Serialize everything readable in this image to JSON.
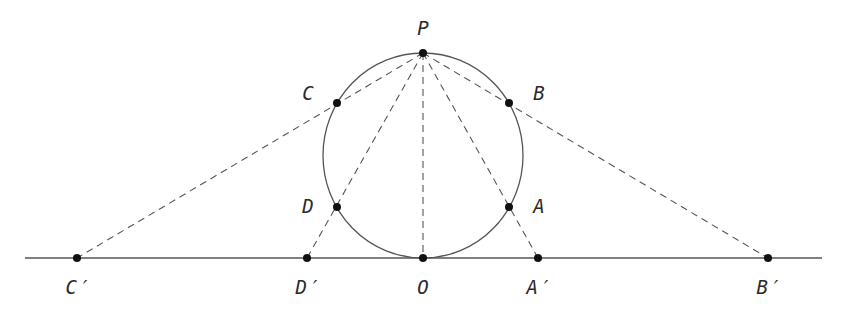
{
  "diagram": {
    "colors": {
      "stroke": "#555555",
      "point": "#111111",
      "text": "#2a2a2a",
      "background": "#ffffff"
    },
    "line": {
      "x1": 25,
      "y1": 258,
      "x2": 822,
      "y2": 258
    },
    "circle": {
      "cx": 423,
      "cy": 155.5,
      "rx": 100,
      "ry": 102.5
    },
    "points": [
      {
        "id": "P",
        "label": "P",
        "x": 423,
        "y": 53,
        "lx": 423,
        "ly": 28
      },
      {
        "id": "C",
        "label": "C",
        "x": 337,
        "y": 103,
        "lx": 308,
        "ly": 93
      },
      {
        "id": "B",
        "label": "B",
        "x": 509,
        "y": 103,
        "lx": 539,
        "ly": 93
      },
      {
        "id": "D",
        "label": "D",
        "x": 337,
        "y": 207,
        "lx": 308,
        "ly": 206
      },
      {
        "id": "A",
        "label": "A",
        "x": 509,
        "y": 207,
        "lx": 539,
        "ly": 206
      },
      {
        "id": "O",
        "label": "O",
        "x": 423,
        "y": 258,
        "lx": 423,
        "ly": 287
      },
      {
        "id": "Cp",
        "label": "C′",
        "x": 77,
        "y": 258,
        "lx": 77,
        "ly": 287
      },
      {
        "id": "Dp",
        "label": "D′",
        "x": 307,
        "y": 258,
        "lx": 307,
        "ly": 287
      },
      {
        "id": "Ap",
        "label": "A′",
        "x": 538,
        "y": 258,
        "lx": 538,
        "ly": 287
      },
      {
        "id": "Bp",
        "label": "B′",
        "x": 768,
        "y": 258,
        "lx": 768,
        "ly": 287
      }
    ],
    "dashed_segments": [
      {
        "from": "P",
        "to": "Cp"
      },
      {
        "from": "P",
        "to": "Dp"
      },
      {
        "from": "P",
        "to": "O"
      },
      {
        "from": "P",
        "to": "Ap"
      },
      {
        "from": "P",
        "to": "Bp"
      }
    ]
  }
}
